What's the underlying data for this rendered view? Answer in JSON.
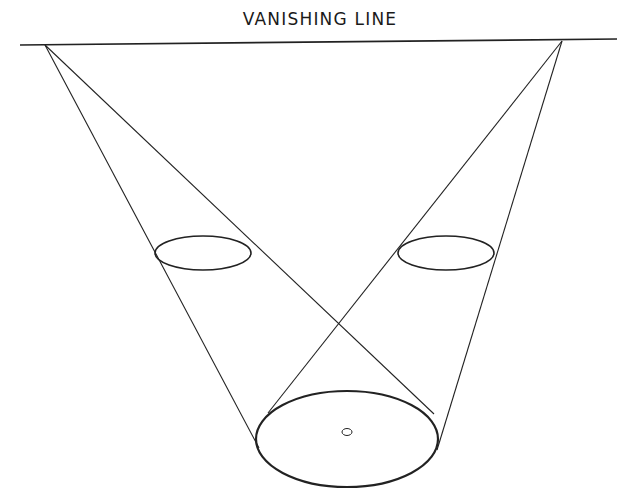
{
  "diagram": {
    "title": "VANISHING LINE",
    "colors": {
      "ink": "#222222",
      "background": "#ffffff"
    },
    "horizon": {
      "x1": 20,
      "y1": 45,
      "x2": 617,
      "y2": 39
    },
    "vanishing_points": [
      {
        "name": "left-vanishing-point",
        "x": 45,
        "y": 45
      },
      {
        "name": "right-vanishing-point",
        "x": 562,
        "y": 41
      }
    ],
    "tangent_lines": [
      {
        "from": "left-vanishing-point",
        "x1": 45,
        "y1": 45,
        "x2": 259,
        "y2": 448
      },
      {
        "from": "left-vanishing-point",
        "x1": 45,
        "y1": 45,
        "x2": 434,
        "y2": 414
      },
      {
        "from": "right-vanishing-point",
        "x1": 562,
        "y1": 41,
        "x2": 268,
        "y2": 413
      },
      {
        "from": "right-vanishing-point",
        "x1": 562,
        "y1": 41,
        "x2": 437,
        "y2": 450
      }
    ],
    "ellipses": [
      {
        "name": "small-ellipse-left",
        "cx": 203,
        "cy": 253,
        "rx": 48,
        "ry": 17
      },
      {
        "name": "small-ellipse-right",
        "cx": 446,
        "cy": 253,
        "rx": 48,
        "ry": 17
      },
      {
        "name": "large-base-ellipse",
        "cx": 347,
        "cy": 439,
        "rx": 91,
        "ry": 48
      }
    ],
    "center_dot": {
      "cx": 347,
      "cy": 432,
      "rx": 5,
      "ry": 3.5
    }
  }
}
